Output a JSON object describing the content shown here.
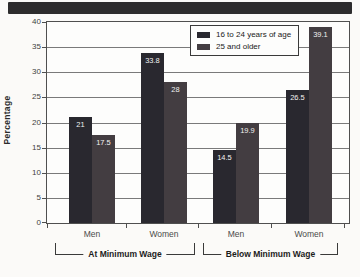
{
  "chart_data": {
    "type": "bar",
    "title": "",
    "ylabel": "Percentage",
    "xlabel": "",
    "ylim": [
      0,
      40
    ],
    "ytick_step": 5,
    "yticks": [
      0,
      5,
      10,
      15,
      20,
      25,
      30,
      35,
      40
    ],
    "grid": "horizontal",
    "legend_position": "top-right-inside",
    "categories": [
      "Men",
      "Women",
      "Men",
      "Women"
    ],
    "group_labels": [
      "At Minimum Wage",
      "Below Minimum Wage"
    ],
    "series": [
      {
        "name": "16 to 24 years of age",
        "color": "#29282f",
        "values": [
          21,
          33.8,
          14.5,
          26.5
        ],
        "value_labels": [
          "21",
          "33.8",
          "14.5",
          "26.5"
        ]
      },
      {
        "name": "25 and older",
        "color": "#433d41",
        "values": [
          17.5,
          28,
          19.9,
          39.1
        ],
        "value_labels": [
          "17.5",
          "28",
          "19.9",
          "39.1"
        ]
      }
    ]
  },
  "banner": {
    "text": ""
  }
}
